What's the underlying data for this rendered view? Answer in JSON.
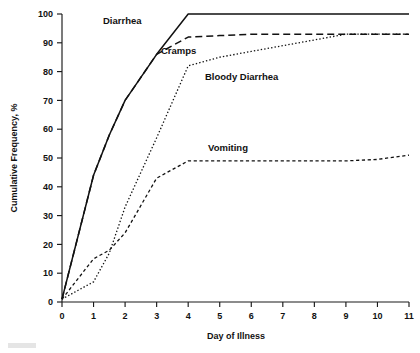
{
  "figure": {
    "caption_fragment": "",
    "background": "#ffffff",
    "ink_color": "#111111"
  },
  "axes": {
    "x": {
      "label": "Day of Illness",
      "ticks": [
        "0",
        "1",
        "2",
        "3",
        "4",
        "5",
        "6",
        "7",
        "8",
        "9",
        "10",
        "11"
      ],
      "min": 0,
      "max": 11
    },
    "y": {
      "label": "Cumulative Frequency, %",
      "ticks": [
        "0",
        "10",
        "20",
        "30",
        "40",
        "50",
        "60",
        "70",
        "80",
        "90",
        "100"
      ],
      "min": 0,
      "max": 100
    }
  },
  "series_labels": [
    {
      "name": "diarrhea-label",
      "text": "Diarrhea"
    },
    {
      "name": "cramps-label",
      "text": "Cramps"
    },
    {
      "name": "bloody-diarrhea-label",
      "text": "Bloody Diarrhea"
    },
    {
      "name": "vomiting-label",
      "text": "Vomiting"
    }
  ],
  "chart_data": {
    "type": "line",
    "title": "",
    "xlabel": "Day of Illness",
    "ylabel": "Cumulative Frequency, %",
    "xlim": [
      0,
      11
    ],
    "ylim": [
      0,
      100
    ],
    "xticks": [
      0,
      1,
      2,
      3,
      4,
      5,
      6,
      7,
      8,
      9,
      10,
      11
    ],
    "yticks": [
      0,
      10,
      20,
      30,
      40,
      50,
      60,
      70,
      80,
      90,
      100
    ],
    "grid": false,
    "legend": "inline-annotations",
    "series": [
      {
        "name": "Diarrhea",
        "style": "solid",
        "x": [
          0,
          1,
          1.5,
          2,
          3,
          4,
          5,
          6,
          7,
          8,
          9,
          10,
          11
        ],
        "values": [
          1,
          44,
          58,
          70,
          86,
          100,
          100,
          100,
          100,
          100,
          100,
          100,
          100
        ]
      },
      {
        "name": "Cramps",
        "style": "dashed",
        "x": [
          0,
          1,
          1.5,
          2,
          3,
          4,
          5,
          6,
          7,
          8,
          9,
          10,
          11
        ],
        "values": [
          1,
          44,
          58,
          70,
          86,
          92,
          92.5,
          93,
          93,
          93,
          93,
          93,
          93
        ]
      },
      {
        "name": "Bloody Diarrhea",
        "style": "dotted",
        "x": [
          0,
          1,
          1.5,
          2,
          3,
          4,
          5,
          6,
          7,
          8,
          9,
          10,
          11
        ],
        "values": [
          1,
          7,
          17,
          33,
          57,
          82,
          85,
          87,
          89,
          91,
          93,
          93,
          93
        ]
      },
      {
        "name": "Vomiting",
        "style": "long-dash",
        "x": [
          0,
          1,
          1.5,
          2,
          3,
          4,
          5,
          6,
          7,
          8,
          9,
          10,
          11
        ],
        "values": [
          1,
          15,
          18,
          24,
          43,
          49,
          49,
          49,
          49,
          49,
          49,
          49.5,
          51
        ]
      }
    ]
  }
}
